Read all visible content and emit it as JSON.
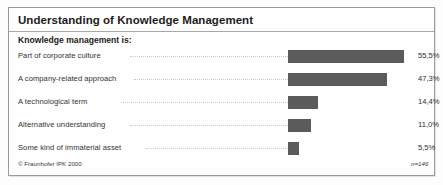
{
  "header": {
    "title": "Understanding of Knowledge Management",
    "subtitle": "Knowledge management is:"
  },
  "footer": {
    "copyright": "© Fraunhofer IPK 2000",
    "sample_size": "n=146"
  },
  "colors": {
    "bar": "#5b5b5b",
    "frame_border": "#9a9a9a",
    "title_rule": "#a8a8a8",
    "leader_dots": "#c9c9c9",
    "background": "#fdfdfd"
  },
  "chart_data": {
    "type": "bar",
    "orientation": "horizontal",
    "title": "Understanding of Knowledge Management",
    "subtitle": "Knowledge management is:",
    "xlabel": "",
    "ylabel": "",
    "xlim": [
      0,
      60
    ],
    "grid": false,
    "legend": null,
    "value_suffix": "%",
    "decimal_separator": ",",
    "categories": [
      "Part of corporate culture",
      "A company-related approach",
      "A technological term",
      "Alternative understanding",
      "Some kind of immaterial asset"
    ],
    "values": [
      55.5,
      47.3,
      14.4,
      11.0,
      5.5
    ],
    "value_labels": [
      "55,5%",
      "47,3%",
      "14,4%",
      "11,0%",
      "5,5%"
    ],
    "annotations": [
      "n=146",
      "© Fraunhofer IPK 2000"
    ]
  }
}
